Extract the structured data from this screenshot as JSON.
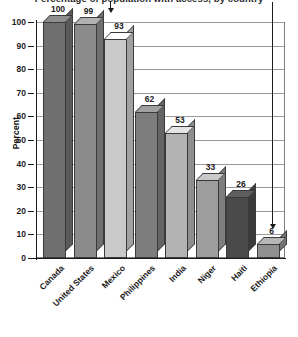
{
  "chart_data": {
    "type": "bar",
    "title": "Percentage of population with access, by country",
    "xlabel": "",
    "ylabel": "Percent",
    "ylim": [
      0,
      100
    ],
    "ytick_step": 10,
    "yticks": [
      "100",
      "90",
      "80",
      "70",
      "60",
      "50",
      "40",
      "30",
      "20",
      "10",
      "0"
    ],
    "grid": true,
    "legend": null,
    "style": "3d-bars",
    "categories": [
      "Canada",
      "United States",
      "Mexico",
      "Philippines",
      "India",
      "Niger",
      "Haiti",
      "Ethiopia"
    ],
    "values": [
      100,
      99,
      93,
      62,
      53,
      33,
      26,
      6
    ],
    "value_labels": [
      "100",
      "99",
      "93",
      "62",
      "53",
      "33",
      "26",
      "6"
    ],
    "bar_colors": [
      "#6f6f6f",
      "#8b8b8b",
      "#c9c9c9",
      "#7d7d7d",
      "#b3b3b3",
      "#9d9d9d",
      "#4a4a4a",
      "#8f8f8f"
    ],
    "annotations": [
      {
        "name": "arrow-to-united-states",
        "target": "United States",
        "label": "99"
      },
      {
        "name": "arrow-to-ethiopia",
        "target": "Ethiopia",
        "label": "6"
      }
    ]
  },
  "axis": {
    "y_title": "Percent"
  }
}
